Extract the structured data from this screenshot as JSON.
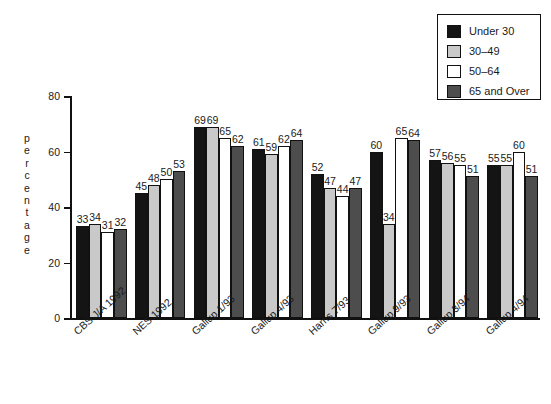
{
  "chart_data": {
    "type": "bar",
    "title": "",
    "xlabel": "",
    "ylabel": "percentage",
    "ylim": [
      0,
      80
    ],
    "yticks": [
      0,
      20,
      40,
      60,
      80
    ],
    "grid": false,
    "legend_position": "top-right",
    "categories": [
      "CBS J/A 1992",
      "NES 1992",
      "Gallup 1/93",
      "Gallup 4/93",
      "Harris 7/93",
      "Gallup 9/93",
      "Gallup 3/94",
      "Gallup 4/94"
    ],
    "series": [
      {
        "name": "Under 30",
        "color": "#141414",
        "values": [
          33,
          45,
          69,
          61,
          52,
          60,
          57,
          55
        ]
      },
      {
        "name": "30–49",
        "color": "#c9c9c9",
        "values": [
          34,
          48,
          69,
          59,
          47,
          34,
          56,
          55
        ]
      },
      {
        "name": "50–64",
        "color": "#ffffff",
        "values": [
          31,
          50,
          65,
          62,
          44,
          65,
          55,
          60
        ]
      },
      {
        "name": "65 and Over",
        "color": "#4d4d4d",
        "values": [
          32,
          53,
          62,
          64,
          47,
          64,
          51,
          51
        ]
      }
    ]
  },
  "legend": {
    "items": [
      {
        "label": "Under 30",
        "color": "#141414"
      },
      {
        "label": "30–49",
        "color": "#c9c9c9"
      },
      {
        "label": "50–64",
        "color": "#ffffff"
      },
      {
        "label": "65 and Over",
        "color": "#4d4d4d"
      }
    ]
  },
  "axis": {
    "y_label_text": "percentage",
    "y_tick_labels": [
      "80",
      "60",
      "40",
      "20",
      "0"
    ]
  }
}
